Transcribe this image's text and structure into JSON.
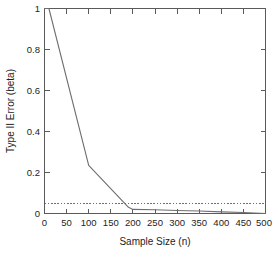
{
  "chart_data": {
    "type": "line",
    "title": "",
    "xlabel": "Sample Size (n)",
    "ylabel": "Type II Error (beta)",
    "xlim": [
      0,
      500
    ],
    "ylim": [
      0,
      1
    ],
    "grid": false,
    "legend": "none",
    "xticks": [
      0,
      50,
      100,
      150,
      200,
      250,
      300,
      350,
      400,
      450,
      500
    ],
    "xtick_labels": [
      "0",
      "50",
      "100",
      "150",
      "200",
      "250",
      "300",
      "350",
      "400",
      "450",
      "500"
    ],
    "yticks": [
      0,
      0.2,
      0.4,
      0.6,
      0.8,
      1
    ],
    "ytick_labels": [
      "0",
      "0.2",
      "0.4",
      "0.6",
      "0.8",
      "1"
    ],
    "series": [
      {
        "name": "Type II Error (beta)",
        "style": "solid",
        "color": "#6e6e6e",
        "x": [
          0,
          10,
          100,
          190,
          200,
          250,
          300,
          350,
          400,
          450,
          500
        ],
        "values": [
          1.0,
          1.0,
          0.235,
          0.03,
          0.02,
          0.018,
          0.015,
          0.012,
          0.008,
          0.005,
          0.0
        ]
      },
      {
        "name": "beta = 0.05 threshold",
        "style": "dashed",
        "color": "#6e6e6e",
        "x": [
          0,
          500
        ],
        "values": [
          0.05,
          0.05
        ]
      }
    ],
    "annotations": []
  },
  "axis": {
    "x_title": "Sample Size (n)",
    "y_title": "Type II Error (beta)"
  }
}
